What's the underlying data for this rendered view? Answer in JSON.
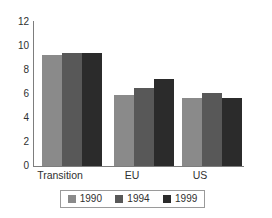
{
  "chart_data": {
    "type": "bar",
    "title": "",
    "subtitle": "",
    "xlabel": "",
    "ylabel": "",
    "categories": [
      "Transition",
      "EU",
      "US"
    ],
    "series": [
      {
        "name": "1990",
        "color": "#8a8a8a",
        "values": [
          9.25,
          5.9,
          5.65
        ]
      },
      {
        "name": "1994",
        "color": "#585858",
        "values": [
          9.4,
          6.5,
          6.05
        ]
      },
      {
        "name": "1999",
        "color": "#2b2b2b",
        "values": [
          9.4,
          7.25,
          5.7
        ]
      }
    ],
    "ylim": [
      0,
      12
    ],
    "ytick_step": 2,
    "ytick_labels": [
      "12",
      "10",
      "8",
      "6",
      "4",
      "2",
      "0"
    ],
    "grid": false,
    "legend_position": "bottom",
    "axis_color": "#7d7d7d",
    "text_color": "#2f2f2f",
    "background": "#ffffff"
  }
}
